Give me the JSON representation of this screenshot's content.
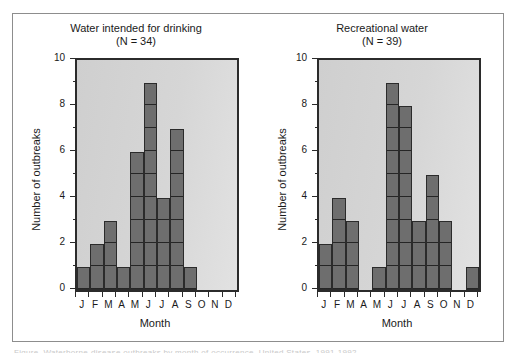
{
  "figure": {
    "caption_sliver": "Figure. Waterborne-disease outbreaks by month of occurrence, United States, 1991-1992",
    "border_color": "#8d8d8d",
    "bar_color": "#6e6e6e",
    "plot_bg_color": "#d3d3d3",
    "axis_color": "#2b2b2b"
  },
  "panels": [
    {
      "id": "water-intended-for-drinking",
      "title": "Water intended for drinking",
      "subtitle": "(N = 34)",
      "xlabel": "Month",
      "ylabel": "Number of outbreaks"
    },
    {
      "id": "recreational-water",
      "title": "Recreational water",
      "subtitle": "(N = 39)",
      "xlabel": "Month",
      "ylabel": "Number of outbreaks"
    }
  ],
  "axis": {
    "y_tick_labels": [
      "10",
      "8",
      "6",
      "4",
      "2",
      "0"
    ],
    "y_tick_values": [
      10,
      8,
      6,
      4,
      2,
      0
    ],
    "y_minor_values": [
      9,
      7,
      5,
      3,
      1
    ],
    "x_tick_labels": [
      "J",
      "F",
      "M",
      "A",
      "M",
      "J",
      "J",
      "A",
      "S",
      "O",
      "N",
      "D"
    ]
  },
  "chart_data": [
    {
      "type": "bar",
      "title": "Water intended for drinking",
      "subtitle": "(N = 34)",
      "xlabel": "Month",
      "ylabel": "Number of outbreaks",
      "categories": [
        "J",
        "F",
        "M",
        "A",
        "M",
        "J",
        "J",
        "A",
        "S",
        "O",
        "N",
        "D"
      ],
      "category_names": [
        "January",
        "February",
        "March",
        "April",
        "May",
        "June",
        "July",
        "August",
        "September",
        "October",
        "November",
        "December"
      ],
      "values": [
        1,
        2,
        3,
        1,
        6,
        9,
        4,
        7,
        1,
        0,
        0,
        0
      ],
      "total": 34,
      "ylim": [
        0,
        10
      ],
      "ytick_step": 2,
      "yminor_step": 1,
      "grid": "unit-blocks-within-bars",
      "legend": "none"
    },
    {
      "type": "bar",
      "title": "Recreational water",
      "subtitle": "(N = 39)",
      "xlabel": "Month",
      "ylabel": "Number of outbreaks",
      "categories": [
        "J",
        "F",
        "M",
        "A",
        "M",
        "J",
        "J",
        "A",
        "S",
        "O",
        "N",
        "D"
      ],
      "category_names": [
        "January",
        "February",
        "March",
        "April",
        "May",
        "June",
        "July",
        "August",
        "September",
        "October",
        "November",
        "December"
      ],
      "values": [
        2,
        4,
        3,
        0,
        1,
        9,
        8,
        3,
        5,
        3,
        0,
        1
      ],
      "total": 39,
      "ylim": [
        0,
        10
      ],
      "ytick_step": 2,
      "yminor_step": 1,
      "grid": "unit-blocks-within-bars",
      "legend": "none"
    }
  ]
}
